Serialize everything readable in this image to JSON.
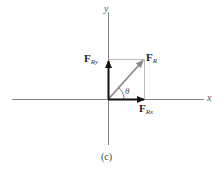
{
  "diagram": {
    "caption": "(c)",
    "axes": {
      "x_label": "x",
      "y_label": "y"
    },
    "vectors": [
      {
        "name": "F",
        "subscript": "R",
        "role": "resultant",
        "color": "#8a8a8a"
      },
      {
        "name": "F",
        "subscript": "Rx",
        "role": "x-component",
        "color": "#111111"
      },
      {
        "name": "F",
        "subscript": "Ry",
        "role": "y-component",
        "color": "#111111"
      }
    ],
    "angle_label": "θ",
    "colors": {
      "axis": "#666666",
      "construction": "#aaaaaa",
      "component": "#111111",
      "resultant": "#8a8a8a"
    }
  }
}
